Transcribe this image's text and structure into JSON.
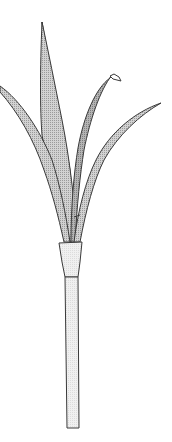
{
  "illustration": {
    "subject": "Leek plant line drawing",
    "colors": {
      "background": "#ffffff",
      "leaf_fill": "#c9c9c9",
      "curled_leaf_fill": "#a9a9a9",
      "stem_fill": "#ececec",
      "outline": "#3a3a3a"
    },
    "parts": [
      "tall center leaf",
      "left leaf",
      "curled leaf",
      "right leaf",
      "sheath",
      "stem"
    ]
  }
}
